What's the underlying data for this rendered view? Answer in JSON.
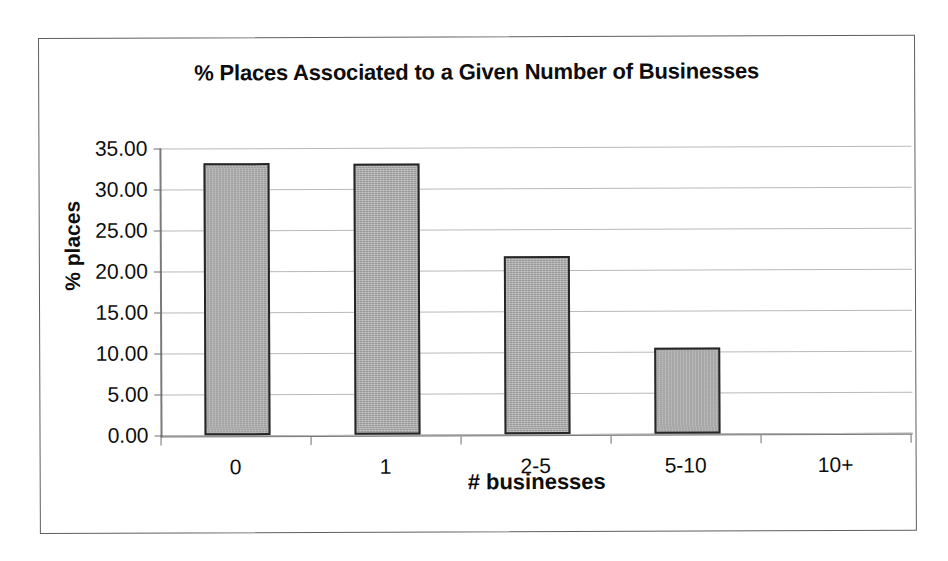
{
  "chart_data": {
    "type": "bar",
    "title": "% Places Associated to a Given Number of Businesses",
    "xlabel": "# businesses",
    "ylabel": "% places",
    "categories": [
      "0",
      "1",
      "2-5",
      "5-10",
      "10+"
    ],
    "values": [
      33.2,
      33.0,
      21.7,
      10.5,
      0.0
    ],
    "ylim": [
      0.0,
      35.0
    ],
    "ytick_labels": [
      "35.00",
      "30.00",
      "25.00",
      "20.00",
      "15.00",
      "10.00",
      "5.00",
      "0.00"
    ],
    "ytick_values": [
      35,
      30,
      25,
      20,
      15,
      10,
      5,
      0
    ],
    "grid": true,
    "legend": false,
    "series": [
      {
        "name": "% places",
        "values": [
          33.2,
          33.0,
          21.7,
          10.5,
          0.0
        ]
      }
    ],
    "colors": {
      "bar_fill": "#a9a9a9",
      "bar_border": "#262626",
      "gridline": "#b9b9b9",
      "axis": "#7b7b7b",
      "text": "#0d0d0d",
      "frame": "#5f5f5f",
      "background": "#ffffff"
    }
  }
}
